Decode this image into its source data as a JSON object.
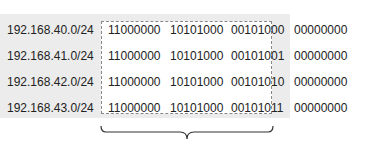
{
  "rows": [
    {
      "network": "192.168.40.0/24",
      "octets": [
        "11000000",
        "10101000",
        "00101000",
        "00000000"
      ]
    },
    {
      "network": "192.168.41.0/24",
      "octets": [
        "11000000",
        "10101000",
        "00101001",
        "00000000"
      ]
    },
    {
      "network": "192.168.42.0/24",
      "octets": [
        "11000000",
        "10101000",
        "00101010",
        "00000000"
      ]
    },
    {
      "network": "192.168.43.0/24",
      "octets": [
        "11000000",
        "10101000",
        "00101011",
        "00000000"
      ]
    }
  ],
  "colors": {
    "background_band": "#ececec",
    "highlight_box": "#ffffff",
    "dashed_border": "#888888",
    "text": "#222222"
  }
}
